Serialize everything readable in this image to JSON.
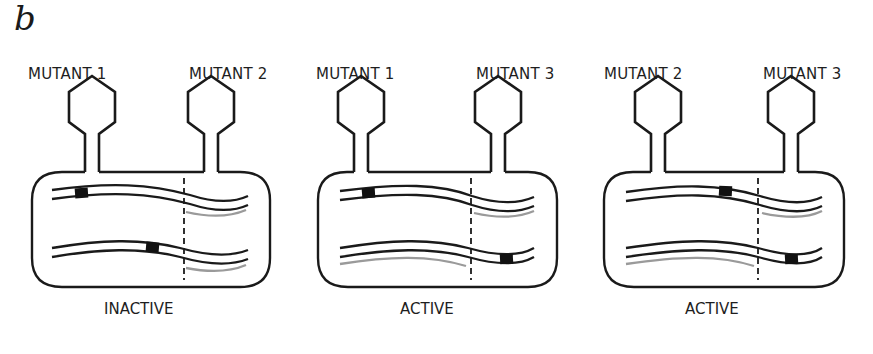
{
  "figure": {
    "panel_letter": "b",
    "colors": {
      "line": "#1a1a1a",
      "gray_strand": "#9a9a9a",
      "mutation_block": "#111111"
    },
    "panels": [
      {
        "left_label": "MUTANT 1",
        "right_label": "MUTANT 2",
        "status": "INACTIVE"
      },
      {
        "left_label": "MUTANT 1",
        "right_label": "MUTANT 3",
        "status": "ACTIVE"
      },
      {
        "left_label": "MUTANT 2",
        "right_label": "MUTANT 3",
        "status": "ACTIVE"
      }
    ]
  }
}
